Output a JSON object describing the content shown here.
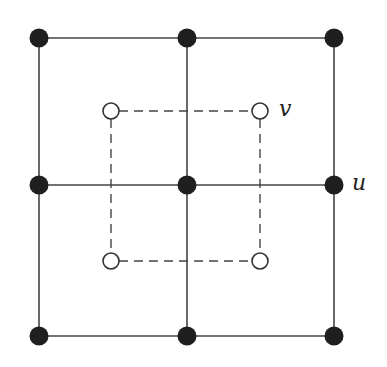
{
  "diagram": {
    "colors": {
      "background": "#ffffff",
      "line": "#444444",
      "filled_node": "#1f1f1f",
      "open_node_fill": "#ffffff",
      "open_node_stroke": "#333333"
    },
    "solid_grid": {
      "x": [
        39,
        187,
        334
      ],
      "y": [
        38,
        185,
        336
      ]
    },
    "dashed_square": {
      "x": [
        111,
        260
      ],
      "y": [
        111,
        261
      ]
    },
    "labels": {
      "v": "v",
      "u": "u"
    }
  }
}
